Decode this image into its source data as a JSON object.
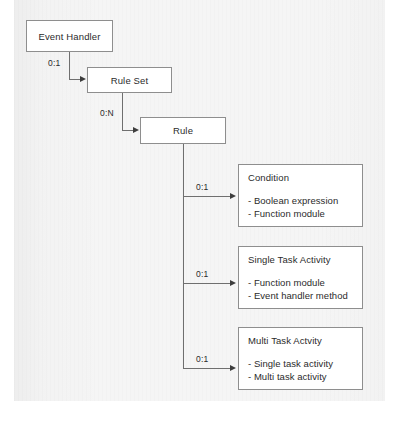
{
  "diagram": {
    "type": "hierarchy-flow",
    "nodes": [
      {
        "id": "event-handler",
        "label": "Event Handler"
      },
      {
        "id": "rule-set",
        "label": "Rule Set"
      },
      {
        "id": "rule",
        "label": "Rule"
      },
      {
        "id": "condition",
        "label": "Condition",
        "items": [
          "- Boolean expression",
          "- Function module"
        ]
      },
      {
        "id": "single-task-activity",
        "label": "Single Task Activity",
        "items": [
          "- Function module",
          "- Event handler method"
        ]
      },
      {
        "id": "multi-task-activity",
        "label": "Multi Task Actvity",
        "items": [
          "- Single task activity",
          "- Multi task activity"
        ]
      }
    ],
    "edges": [
      {
        "id": "event-handler-to-rule-set",
        "from": "event-handler",
        "to": "rule-set",
        "cardinality": "0:1"
      },
      {
        "id": "rule-set-to-rule",
        "from": "rule-set",
        "to": "rule",
        "cardinality": "0:N"
      },
      {
        "id": "rule-to-condition",
        "from": "rule",
        "to": "condition",
        "cardinality": "0:1"
      },
      {
        "id": "rule-to-single-task-activity",
        "from": "rule",
        "to": "single-task-activity",
        "cardinality": "0:1"
      },
      {
        "id": "rule-to-multi-task-activity",
        "from": "rule",
        "to": "multi-task-activity",
        "cardinality": "0:1"
      }
    ]
  },
  "caption": {
    "text": ""
  },
  "colors": {
    "page_background": "#ffffff",
    "panel_background": "#f5f5f5",
    "box_fill": "#ffffff",
    "box_border": "#8e8e8e",
    "connector": "#6f6f6f",
    "arrow": "#3d3d3d",
    "text": "#2b2b2b"
  }
}
